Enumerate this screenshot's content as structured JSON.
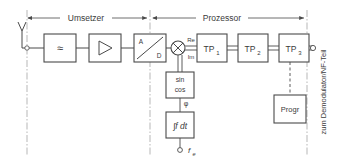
{
  "diagram": {
    "type": "block-diagram",
    "language": "de",
    "stroke_color": "#4a4a4a",
    "text_color": "#3b3b3b",
    "background": "#ffffff"
  },
  "sections": [
    {
      "id": "umsetzer",
      "label": "Umsetzer",
      "x_start": 27,
      "x_end": 148
    },
    {
      "id": "prozessor",
      "label": "Prozessor",
      "x_start": 152,
      "x_end": 305
    }
  ],
  "output_label": "zum Demodulator/NF-Teil",
  "antenna": {
    "name": "antenna",
    "label": ""
  },
  "blocks": [
    {
      "id": "bandpass",
      "label": "≈",
      "x": 44,
      "y": 34,
      "w": 32,
      "h": 28
    },
    {
      "id": "amplifier",
      "label": "▷",
      "x": 89,
      "y": 34,
      "w": 32,
      "h": 28
    },
    {
      "id": "adc",
      "label": "A / D",
      "x": 134,
      "y": 34,
      "w": 32,
      "h": 28
    },
    {
      "id": "tp1",
      "label": "TP",
      "sub": "1",
      "x": 197,
      "y": 34,
      "w": 30,
      "h": 28
    },
    {
      "id": "tp2",
      "label": "TP",
      "sub": "2",
      "x": 238,
      "y": 34,
      "w": 30,
      "h": 28
    },
    {
      "id": "tp3",
      "label": "TP",
      "sub": "3",
      "x": 279,
      "y": 34,
      "w": 30,
      "h": 28
    },
    {
      "id": "sincos",
      "label": "sin",
      "label2": "cos",
      "x": 166,
      "y": 72,
      "w": 28,
      "h": 26
    },
    {
      "id": "integrator",
      "label": "∫f dt",
      "x": 166,
      "y": 112,
      "w": 28,
      "h": 26
    },
    {
      "id": "progr",
      "label": "Progr",
      "x": 274,
      "y": 95,
      "w": 32,
      "h": 28
    }
  ],
  "signal_labels": {
    "real": "Re",
    "imag": "Im",
    "phase": "φ",
    "frequency": "f",
    "frequency_sub": "e"
  },
  "nodes": {
    "mixer": {
      "name": "mixer",
      "cx": 178,
      "cy": 48,
      "r": 7
    },
    "output_terminal": {
      "name": "output-terminal",
      "cx": 313,
      "cy": 48,
      "r": 3
    },
    "antenna_junction": {
      "name": "antenna-junction",
      "cx": 27,
      "cy": 48,
      "r": 2.5
    },
    "adc_junction": {
      "name": "adc-junction",
      "cx": 148,
      "cy": 48,
      "r": 2.5
    },
    "fe_terminal": {
      "name": "fe-terminal",
      "cx": 180,
      "cy": 150,
      "r": 2.5
    }
  }
}
